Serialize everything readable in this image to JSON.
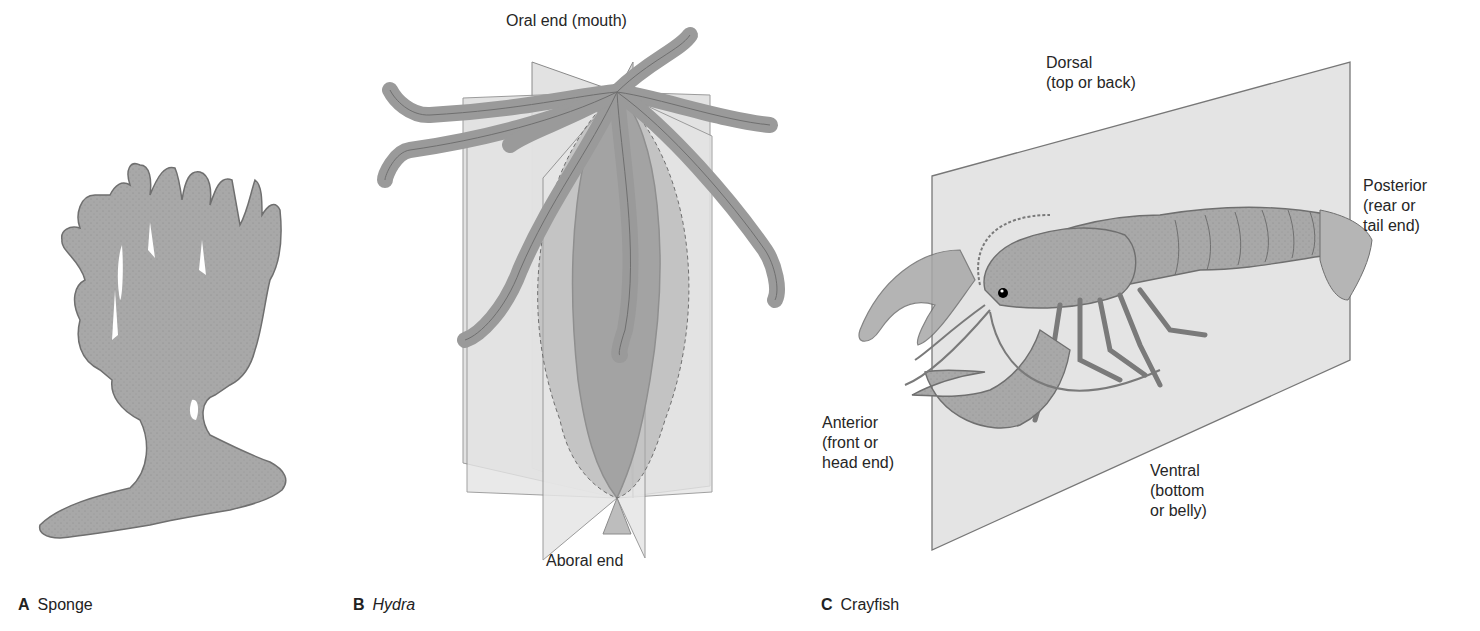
{
  "figure": {
    "panels": [
      {
        "letter": "A",
        "name": "Sponge",
        "italic": false
      },
      {
        "letter": "B",
        "name": "Hydra",
        "italic": true
      },
      {
        "letter": "C",
        "name": "Crayfish",
        "italic": false
      }
    ],
    "hydra_labels": {
      "top": "Oral end (mouth)",
      "bottom": "Aboral end"
    },
    "crayfish_labels": {
      "dorsal": "Dorsal\n(top or back)",
      "posterior": "Posterior\n(rear or\ntail end)",
      "anterior": "Anterior\n(front or\nhead end)",
      "ventral": "Ventral\n(bottom\nor belly)"
    },
    "colors": {
      "organism_fill": "#a9a9a9",
      "organism_stroke": "#6f6f6f",
      "plane_fill": "#dcdcdc",
      "plane_stroke": "#8a8a8a",
      "text": "#262626"
    }
  }
}
